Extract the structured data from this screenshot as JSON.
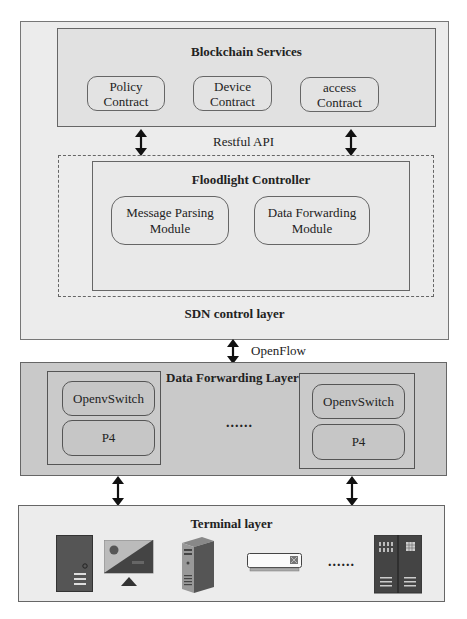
{
  "diagram": {
    "blockchain_services": {
      "title": "Blockchain Services",
      "contracts": [
        {
          "line1": "Policy",
          "line2": "Contract"
        },
        {
          "line1": "Device",
          "line2": "Contract"
        },
        {
          "line1": "access",
          "line2": "Contract"
        }
      ]
    },
    "restful_api_label": "Restful API",
    "sdn_control_layer": {
      "controller_title": "Floodlight Controller",
      "modules": [
        {
          "line1": "Message Parsing",
          "line2": "Module"
        },
        {
          "line1": "Data Forwarding",
          "line2": "Module"
        }
      ],
      "layer_label": "SDN control layer"
    },
    "openflow_label": "OpenFlow",
    "data_forwarding_layer": {
      "title": "Data Forwarding Layer",
      "switches": [
        {
          "top": "OpenvSwitch",
          "bottom": "P4"
        },
        {
          "top": "OpenvSwitch",
          "bottom": "P4"
        }
      ],
      "ellipsis": "......"
    },
    "terminal_layer": {
      "title": "Terminal layer",
      "devices": [
        "desktop-tower-icon",
        "monitor-icon",
        "server-icon",
        "air-conditioner-icon",
        "server-rack-icon"
      ],
      "ellipsis": "......"
    },
    "colors": {
      "outer_bg": "#ececec",
      "blockchain_bg": "#e1e1e1",
      "forwarding_bg": "#c9c9c9",
      "terminal_bg": "#ececec",
      "device_dark": "#4a4a4a"
    }
  }
}
